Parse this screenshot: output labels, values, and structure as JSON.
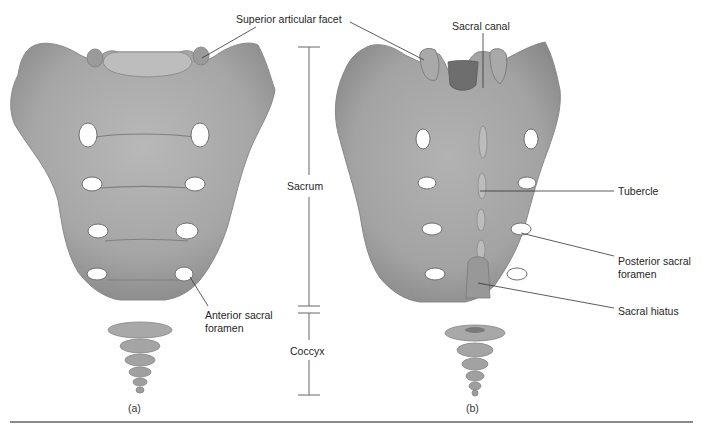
{
  "figure": {
    "panels": [
      {
        "id": "a",
        "caption": "(a)",
        "view": "anterior"
      },
      {
        "id": "b",
        "caption": "(b)",
        "view": "posterior"
      }
    ],
    "labels": {
      "superior_articular_facet": "Superior articular facet",
      "sacral_canal": "Sacral canal",
      "tubercle": "Tubercle",
      "posterior_sacral_foramen_line1": "Posterior sacral",
      "posterior_sacral_foramen_line2": "foramen",
      "sacral_hiatus": "Sacral hiatus",
      "anterior_sacral_foramen_line1": "Anterior sacral",
      "anterior_sacral_foramen_line2": "foramen"
    },
    "brackets": {
      "sacrum": "Sacrum",
      "coccyx": "Coccyx"
    },
    "colors": {
      "bone": "#a9a9a9",
      "bone_shadow": "#8c8c8c",
      "bone_highlight": "#c4c4c4",
      "leader_line": "#333333",
      "rule": "#8a8a8a"
    }
  }
}
